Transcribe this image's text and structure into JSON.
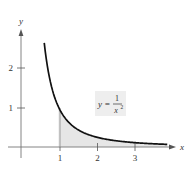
{
  "chart_data": {
    "type": "area",
    "title": "",
    "function": "y = 1/x^2",
    "xlabel": "x",
    "ylabel": "y",
    "x_ticks": [
      "1",
      "2",
      "3"
    ],
    "y_ticks": [
      "1",
      "2"
    ],
    "xlim": [
      -0.15,
      4.1
    ],
    "ylim": [
      -0.2,
      2.6
    ],
    "grid": false,
    "curve": {
      "x": [
        0.62,
        0.7,
        0.8,
        0.9,
        1.0,
        1.25,
        1.5,
        2.0,
        2.5,
        3.0,
        3.5,
        3.9
      ],
      "y": [
        2.6,
        2.04,
        1.56,
        1.23,
        1.0,
        0.64,
        0.44,
        0.25,
        0.16,
        0.11,
        0.08,
        0.066
      ]
    },
    "shaded_region": {
      "from_x": 1,
      "to_x": 3.9,
      "under": "y = 1/x^2",
      "color": "#e6e6e6"
    },
    "annotation": {
      "lhs": "y =",
      "numerator": "1",
      "denominator": "x",
      "exponent": "2"
    },
    "colors": {
      "curve": "#111111",
      "axes": "#777777",
      "shade": "#e6e6e6",
      "label_box": "#eeeeee"
    }
  }
}
